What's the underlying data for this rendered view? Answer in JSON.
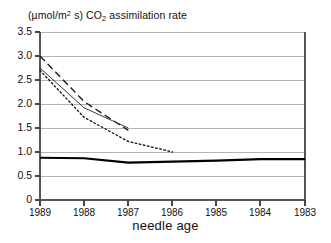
{
  "chart_data": {
    "type": "line",
    "title": "(µmol/m2 s) CO2 assimilation rate",
    "title_parts": {
      "prefix": "(µmol/m",
      "sup": "2",
      "mid": " s) CO",
      "sub": "2",
      "suffix": " assimilation rate"
    },
    "xlabel": "needle age",
    "ylabel": "",
    "x": [
      "1989",
      "1988",
      "1987",
      "1986",
      "1985",
      "1984",
      "1983"
    ],
    "categories": [
      "1989",
      "1988",
      "1987",
      "1986",
      "1985",
      "1984",
      "1983"
    ],
    "xtick_labels": [
      "1989",
      "1988",
      "1987",
      "1986",
      "1985",
      "1984",
      "1983"
    ],
    "ytick_labels": [
      "3.5",
      "3.0",
      "2.5",
      "2.0",
      "1.5",
      "1.0",
      "0.5",
      "0"
    ],
    "ytick_values": [
      3.5,
      3.0,
      2.5,
      2.0,
      1.5,
      1.0,
      0.5,
      0
    ],
    "ylim": [
      0,
      3.5
    ],
    "grid": "horizontal",
    "legend": "none",
    "series": [
      {
        "name": "series-dashed",
        "style": "dashed",
        "color": "#1a1a1a",
        "width": 1.4,
        "x": [
          "1989",
          "1988",
          "1987"
        ],
        "values": [
          3.0,
          2.05,
          1.45
        ]
      },
      {
        "name": "series-solid-thin",
        "style": "solid",
        "color": "#3a3a3a",
        "width": 1.0,
        "x": [
          "1989",
          "1988",
          "1987"
        ],
        "values": [
          2.75,
          1.92,
          1.5
        ]
      },
      {
        "name": "series-dotted",
        "style": "dotted",
        "color": "#1a1a1a",
        "width": 1.4,
        "x": [
          "1989",
          "1988",
          "1987",
          "1986"
        ],
        "values": [
          2.7,
          1.72,
          1.22,
          1.0
        ]
      },
      {
        "name": "series-solid-thick",
        "style": "solid",
        "color": "#000000",
        "width": 2.2,
        "x": [
          "1989",
          "1988",
          "1987",
          "1986",
          "1985",
          "1984",
          "1983"
        ],
        "values": [
          0.88,
          0.87,
          0.78,
          0.8,
          0.82,
          0.85,
          0.85
        ]
      }
    ]
  }
}
